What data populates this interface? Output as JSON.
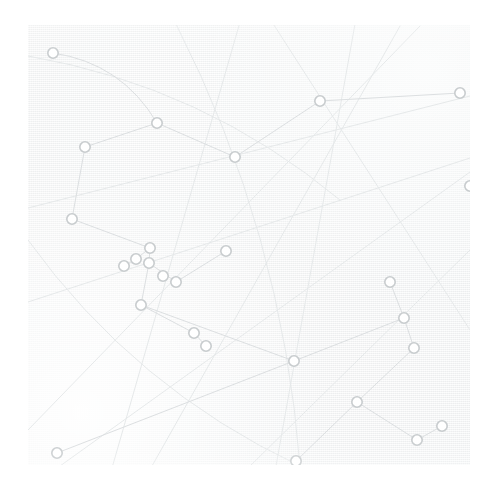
{
  "canvas": {
    "width": 496,
    "height": 498,
    "background_color": "#ffffff",
    "panel": {
      "x": 28,
      "y": 25,
      "width": 442,
      "height": 440,
      "color": "#f5f6f6"
    },
    "description": "Faint abstract network constellation graphic: small open circle nodes joined by thin pale gray straight and curved lines over a lightly textured off-white paper panel."
  },
  "style": {
    "edge_color": "#dcdfe1",
    "edge_color_faint": "#e6e9ea",
    "edge_width": 1,
    "node_stroke_color": "#c8ccce",
    "node_fill_color": "#ffffff",
    "node_radius": 5.2,
    "node_stroke_width": 1.6
  },
  "chart_data": {
    "type": "scatter",
    "title": "",
    "subtitle": "",
    "xlabel": "",
    "ylabel": "",
    "xlim": [
      0,
      496
    ],
    "ylim": [
      0,
      498
    ],
    "grid": false,
    "legend": null,
    "annotations": [],
    "tick_labels": {
      "x": [],
      "y": []
    },
    "node_count": 27,
    "edge_count": 24,
    "nodes": [
      {
        "id": "n1",
        "x": 53,
        "y": 53
      },
      {
        "id": "n2",
        "x": 85,
        "y": 147
      },
      {
        "id": "n3",
        "x": 157,
        "y": 123
      },
      {
        "id": "n4",
        "x": 235,
        "y": 157
      },
      {
        "id": "n5",
        "x": 320,
        "y": 101
      },
      {
        "id": "n6",
        "x": 460,
        "y": 93
      },
      {
        "id": "n7",
        "x": 72,
        "y": 219
      },
      {
        "id": "n8",
        "x": 226,
        "y": 251
      },
      {
        "id": "n9",
        "x": 150,
        "y": 248
      },
      {
        "id": "n10",
        "x": 136,
        "y": 259
      },
      {
        "id": "n11",
        "x": 124,
        "y": 266
      },
      {
        "id": "n12",
        "x": 149,
        "y": 263
      },
      {
        "id": "n13",
        "x": 176,
        "y": 282
      },
      {
        "id": "n14",
        "x": 141,
        "y": 305
      },
      {
        "id": "n15",
        "x": 194,
        "y": 333
      },
      {
        "id": "n16",
        "x": 206,
        "y": 346
      },
      {
        "id": "n17",
        "x": 294,
        "y": 361
      },
      {
        "id": "n18",
        "x": 390,
        "y": 282
      },
      {
        "id": "n19",
        "x": 404,
        "y": 318
      },
      {
        "id": "n20",
        "x": 414,
        "y": 348
      },
      {
        "id": "n21",
        "x": 357,
        "y": 402
      },
      {
        "id": "n22",
        "x": 442,
        "y": 426
      },
      {
        "id": "n23",
        "x": 417,
        "y": 440
      },
      {
        "id": "n24",
        "x": 296,
        "y": 461
      },
      {
        "id": "n25",
        "x": 57,
        "y": 453
      },
      {
        "id": "n26",
        "x": 470,
        "y": 186
      },
      {
        "id": "n27",
        "x": 163,
        "y": 276
      }
    ],
    "edges": [
      {
        "from": "n1",
        "to": "n3",
        "curve": true
      },
      {
        "from": "n2",
        "to": "n3",
        "curve": false
      },
      {
        "from": "n3",
        "to": "n4",
        "curve": false
      },
      {
        "from": "n4",
        "to": "n5",
        "curve": false
      },
      {
        "from": "n5",
        "to": "n6",
        "curve": false
      },
      {
        "from": "n2",
        "to": "n7",
        "curve": false
      },
      {
        "from": "n7",
        "to": "n9",
        "curve": false
      },
      {
        "from": "n9",
        "to": "n10",
        "curve": false
      },
      {
        "from": "n10",
        "to": "n11",
        "curve": false
      },
      {
        "from": "n9",
        "to": "n12",
        "curve": false
      },
      {
        "from": "n12",
        "to": "n13",
        "curve": false
      },
      {
        "from": "n12",
        "to": "n14",
        "curve": false
      },
      {
        "from": "n14",
        "to": "n15",
        "curve": false
      },
      {
        "from": "n15",
        "to": "n16",
        "curve": false
      },
      {
        "from": "n14",
        "to": "n17",
        "curve": false
      },
      {
        "from": "n17",
        "to": "n19",
        "curve": false
      },
      {
        "from": "n18",
        "to": "n19",
        "curve": false
      },
      {
        "from": "n19",
        "to": "n20",
        "curve": false
      },
      {
        "from": "n20",
        "to": "n21",
        "curve": false
      },
      {
        "from": "n21",
        "to": "n24",
        "curve": false
      },
      {
        "from": "n21",
        "to": "n23",
        "curve": false
      },
      {
        "from": "n23",
        "to": "n22",
        "curve": false
      },
      {
        "from": "n25",
        "to": "n17",
        "curve": false
      },
      {
        "from": "n8",
        "to": "n13",
        "curve": false
      }
    ],
    "long_lines": [
      {
        "id": "L1",
        "x1": 240,
        "y1": 22,
        "x2": 112,
        "y2": 468,
        "curve": false
      },
      {
        "id": "L2",
        "x1": 28,
        "y1": 208,
        "x2": 470,
        "y2": 96,
        "curve": false
      },
      {
        "id": "L3",
        "x1": 272,
        "y1": 22,
        "x2": 470,
        "y2": 330,
        "curve": false
      },
      {
        "id": "L4",
        "x1": 28,
        "y1": 302,
        "x2": 470,
        "y2": 158,
        "curve": false
      },
      {
        "id": "L5",
        "x1": 60,
        "y1": 466,
        "x2": 470,
        "y2": 172,
        "curve": false
      },
      {
        "id": "L6",
        "x1": 28,
        "y1": 430,
        "x2": 420,
        "y2": 26,
        "curve": false
      },
      {
        "id": "L7",
        "x1": 355,
        "y1": 24,
        "x2": 276,
        "y2": 466,
        "curve": false
      },
      {
        "id": "L8",
        "x1": 470,
        "y1": 250,
        "x2": 250,
        "y2": 466,
        "curve": false
      },
      {
        "id": "L9",
        "x1": 28,
        "y1": 56,
        "x2": 340,
        "y2": 200,
        "curve": true
      },
      {
        "id": "L10",
        "x1": 28,
        "y1": 240,
        "x2": 300,
        "y2": 466,
        "curve": true
      },
      {
        "id": "L11",
        "x1": 176,
        "y1": 24,
        "x2": 300,
        "y2": 466,
        "curve": true
      },
      {
        "id": "L12",
        "x1": 400,
        "y1": 26,
        "x2": 152,
        "y2": 466,
        "curve": false
      }
    ]
  }
}
